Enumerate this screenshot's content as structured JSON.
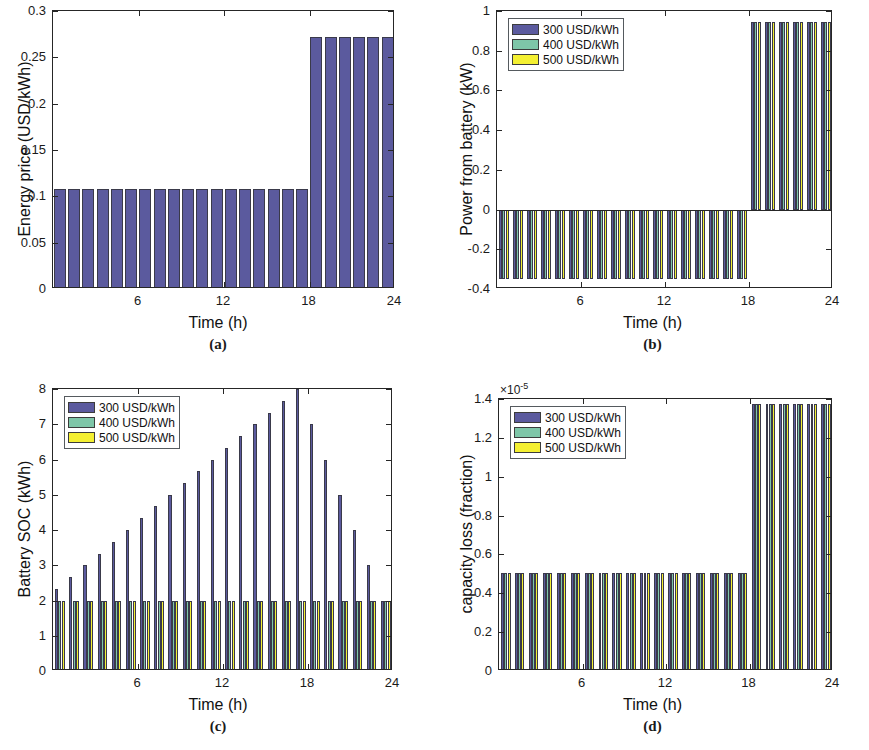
{
  "figure": {
    "panels": [
      "a",
      "b",
      "c",
      "d"
    ]
  },
  "colors": {
    "series_300": "#5b5a9e",
    "series_400": "#7ec6a8",
    "series_500": "#f4f032",
    "axis": "#262626",
    "text": "#111111",
    "background": "#ffffff"
  },
  "legend": {
    "entries": [
      {
        "label": "300 USD/kWh",
        "color": "#5b5a9e"
      },
      {
        "label": "400 USD/kWh",
        "color": "#7ec6a8"
      },
      {
        "label": "500 USD/kWh",
        "color": "#f4f032"
      }
    ]
  },
  "captions": {
    "a": "(a)",
    "b": "(b)",
    "c": "(c)",
    "d": "(d)"
  },
  "chart_data": [
    {
      "id": "a",
      "type": "bar",
      "title": "",
      "xlabel": "Time (h)",
      "ylabel": "Energy price (USD/kWh)",
      "xlim": [
        0,
        24
      ],
      "ylim": [
        0,
        0.3
      ],
      "xticks": [
        6,
        12,
        18,
        24
      ],
      "xticklabels": [
        "6",
        "12",
        "18",
        "24"
      ],
      "yticks": [
        0,
        0.05,
        0.1,
        0.15,
        0.2,
        0.25,
        0.3
      ],
      "yticklabels": [
        "0",
        "0.05",
        "0.1",
        "0.15",
        "0.2",
        "0.25",
        "0.3"
      ],
      "grid": false,
      "legend": false,
      "legend_position": "none",
      "x": [
        1,
        2,
        3,
        4,
        5,
        6,
        7,
        8,
        9,
        10,
        11,
        12,
        13,
        14,
        15,
        16,
        17,
        18,
        19,
        20,
        21,
        22,
        23,
        24
      ],
      "series": [
        {
          "name": "300 USD/kWh",
          "color": "#5b5a9e",
          "values": [
            0.108,
            0.108,
            0.108,
            0.108,
            0.108,
            0.108,
            0.108,
            0.108,
            0.108,
            0.108,
            0.108,
            0.108,
            0.108,
            0.108,
            0.108,
            0.108,
            0.108,
            0.108,
            0.272,
            0.272,
            0.272,
            0.272,
            0.272,
            0.272
          ]
        }
      ]
    },
    {
      "id": "b",
      "type": "bar",
      "title": "",
      "xlabel": "Time (h)",
      "ylabel": "Power from battery (kW)",
      "xlim": [
        0,
        24
      ],
      "ylim": [
        -0.4,
        1
      ],
      "xticks": [
        6,
        12,
        18,
        24
      ],
      "xticklabels": [
        "6",
        "12",
        "18",
        "24"
      ],
      "yticks": [
        -0.4,
        -0.2,
        0,
        0.2,
        0.4,
        0.6,
        0.8,
        1
      ],
      "yticklabels": [
        "-0.4",
        "-0.2",
        "0",
        "0.2",
        "0.4",
        "0.6",
        "0.8",
        "1"
      ],
      "grid": false,
      "legend": true,
      "legend_position": "upper-left",
      "x": [
        1,
        2,
        3,
        4,
        5,
        6,
        7,
        8,
        9,
        10,
        11,
        12,
        13,
        14,
        15,
        16,
        17,
        18,
        19,
        20,
        21,
        22,
        23,
        24
      ],
      "series": [
        {
          "name": "300 USD/kWh",
          "color": "#5b5a9e",
          "values": [
            -0.35,
            -0.35,
            -0.35,
            -0.35,
            -0.35,
            -0.35,
            -0.35,
            -0.35,
            -0.35,
            -0.35,
            -0.35,
            -0.35,
            -0.35,
            -0.35,
            -0.35,
            -0.35,
            -0.35,
            -0.35,
            0.945,
            0.945,
            0.945,
            0.945,
            0.945,
            0.945
          ]
        },
        {
          "name": "400 USD/kWh",
          "color": "#7ec6a8",
          "values": [
            -0.35,
            -0.35,
            -0.35,
            -0.35,
            -0.35,
            -0.35,
            -0.35,
            -0.35,
            -0.35,
            -0.35,
            -0.35,
            -0.35,
            -0.35,
            -0.35,
            -0.35,
            -0.35,
            -0.35,
            -0.35,
            0.945,
            0.945,
            0.945,
            0.945,
            0.945,
            0.945
          ]
        },
        {
          "name": "500 USD/kWh",
          "color": "#f4f032",
          "values": [
            -0.35,
            -0.35,
            -0.35,
            -0.35,
            -0.35,
            -0.35,
            -0.35,
            -0.35,
            -0.35,
            -0.35,
            -0.35,
            -0.35,
            -0.35,
            -0.35,
            -0.35,
            -0.35,
            -0.35,
            -0.35,
            0.945,
            0.945,
            0.945,
            0.945,
            0.945,
            0.945
          ]
        }
      ]
    },
    {
      "id": "c",
      "type": "bar",
      "title": "",
      "xlabel": "Time (h)",
      "ylabel": "Battery SOC (kWh)",
      "xlim": [
        0,
        24
      ],
      "ylim": [
        0,
        8
      ],
      "xticks": [
        6,
        12,
        18,
        24
      ],
      "xticklabels": [
        "6",
        "12",
        "18",
        "24"
      ],
      "yticks": [
        0,
        1,
        2,
        3,
        4,
        5,
        6,
        7,
        8
      ],
      "yticklabels": [
        "0",
        "1",
        "2",
        "3",
        "4",
        "5",
        "6",
        "7",
        "8"
      ],
      "grid": false,
      "legend": true,
      "legend_position": "upper-left",
      "x": [
        1,
        2,
        3,
        4,
        5,
        6,
        7,
        8,
        9,
        10,
        11,
        12,
        13,
        14,
        15,
        16,
        17,
        18,
        19,
        20,
        21,
        22,
        23,
        24
      ],
      "series": [
        {
          "name": "300 USD/kWh",
          "color": "#5b5a9e",
          "values": [
            2.33,
            2.67,
            3.0,
            3.33,
            3.67,
            4.0,
            4.33,
            4.67,
            5.0,
            5.33,
            5.67,
            6.0,
            6.33,
            6.67,
            7.0,
            7.33,
            7.67,
            8.0,
            7.0,
            6.0,
            5.0,
            4.0,
            3.0,
            2.0
          ]
        },
        {
          "name": "400 USD/kWh",
          "color": "#7ec6a8",
          "values": [
            2.0,
            2.0,
            2.0,
            2.0,
            2.0,
            2.0,
            2.0,
            2.0,
            2.0,
            2.0,
            2.0,
            2.0,
            2.0,
            2.0,
            2.0,
            2.0,
            2.0,
            2.0,
            2.0,
            2.0,
            2.0,
            2.0,
            2.0,
            2.0
          ]
        },
        {
          "name": "500 USD/kWh",
          "color": "#f4f032",
          "values": [
            2.0,
            2.0,
            2.0,
            2.0,
            2.0,
            2.0,
            2.0,
            2.0,
            2.0,
            2.0,
            2.0,
            2.0,
            2.0,
            2.0,
            2.0,
            2.0,
            2.0,
            2.0,
            2.0,
            2.0,
            2.0,
            2.0,
            2.0,
            2.0
          ]
        }
      ]
    },
    {
      "id": "d",
      "type": "bar",
      "title": "",
      "xlabel": "Time (h)",
      "ylabel": "capacity loss (fraction)",
      "exponent_label": "×10",
      "exponent_value": "-5",
      "xlim": [
        0,
        24
      ],
      "ylim": [
        0,
        1.4
      ],
      "xticks": [
        6,
        12,
        18,
        24
      ],
      "xticklabels": [
        "6",
        "12",
        "18",
        "24"
      ],
      "yticks": [
        0,
        0.2,
        0.4,
        0.6,
        0.8,
        1,
        1.2,
        1.4
      ],
      "yticklabels": [
        "0",
        "0.2",
        "0.4",
        "0.6",
        "0.8",
        "1",
        "1.2",
        "1.4"
      ],
      "grid": false,
      "legend": true,
      "legend_position": "upper-left",
      "x": [
        1,
        2,
        3,
        4,
        5,
        6,
        7,
        8,
        9,
        10,
        11,
        12,
        13,
        14,
        15,
        16,
        17,
        18,
        19,
        20,
        21,
        22,
        23,
        24
      ],
      "series": [
        {
          "name": "300 USD/kWh",
          "color": "#5b5a9e",
          "values": [
            0.505,
            0.505,
            0.505,
            0.505,
            0.505,
            0.505,
            0.505,
            0.505,
            0.505,
            0.505,
            0.505,
            0.505,
            0.505,
            0.505,
            0.505,
            0.505,
            0.505,
            0.505,
            1.375,
            1.375,
            1.375,
            1.375,
            1.375,
            1.375
          ]
        },
        {
          "name": "400 USD/kWh",
          "color": "#7ec6a8",
          "values": [
            0.505,
            0.505,
            0.505,
            0.505,
            0.505,
            0.505,
            0.505,
            0.505,
            0.505,
            0.505,
            0.505,
            0.505,
            0.505,
            0.505,
            0.505,
            0.505,
            0.505,
            0.505,
            1.375,
            1.375,
            1.375,
            1.375,
            1.375,
            1.375
          ]
        },
        {
          "name": "500 USD/kWh",
          "color": "#f4f032",
          "values": [
            0.505,
            0.505,
            0.505,
            0.505,
            0.505,
            0.505,
            0.505,
            0.505,
            0.505,
            0.505,
            0.505,
            0.505,
            0.505,
            0.505,
            0.505,
            0.505,
            0.505,
            0.505,
            1.375,
            1.375,
            1.375,
            1.375,
            1.375,
            1.375
          ]
        }
      ]
    }
  ]
}
